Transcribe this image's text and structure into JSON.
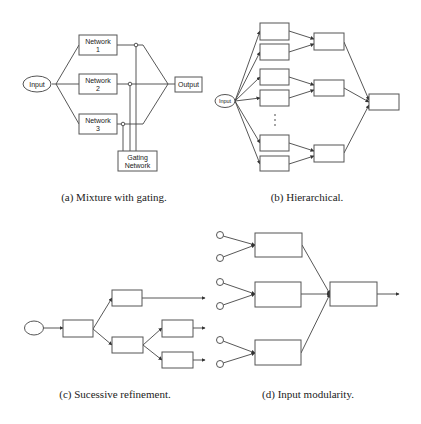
{
  "figure": {
    "panels": [
      {
        "id": "a",
        "caption": "(a) Mixture with gating.",
        "input_label": "Input",
        "networks": [
          {
            "line1": "Network",
            "line2": "1"
          },
          {
            "line1": "Network",
            "line2": "2"
          },
          {
            "line1": "Network",
            "line2": "3"
          }
        ],
        "gating": {
          "line1": "Gating",
          "line2": "Network"
        },
        "output_label": "Output"
      },
      {
        "id": "b",
        "caption": "(b) Hierarchical.",
        "input_label": "Input",
        "ellipsis": "⋮"
      },
      {
        "id": "c",
        "caption": "(c) Sucessive refinement."
      },
      {
        "id": "d",
        "caption": "(d) Input modularity."
      }
    ]
  }
}
